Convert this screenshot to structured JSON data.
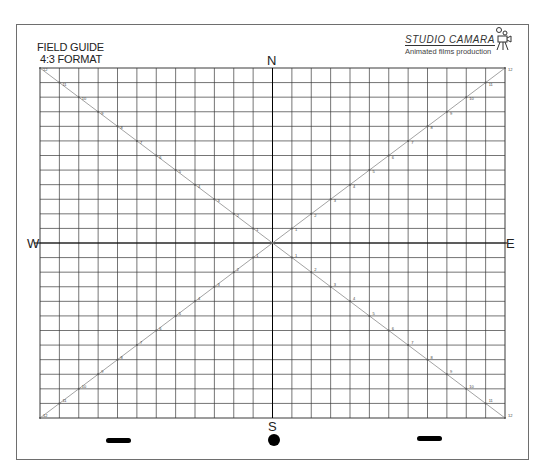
{
  "header": {
    "title_line1": "FIELD GUIDE",
    "title_line2": "4:3 FORMAT"
  },
  "logo": {
    "name": "STUDIO CAMARA",
    "tagline": "Animated films production",
    "icon": "camera-doodle-icon"
  },
  "compass": {
    "north": "N",
    "south": "S",
    "east": "E",
    "west": "W"
  },
  "grid": {
    "columns": 24,
    "rows": 24,
    "left": 40,
    "top": 68,
    "right": 505,
    "bottom": 418,
    "line_color": "#3a3a3a",
    "axis_color": "#000000",
    "diagonal_color": "#8a8a8a",
    "field_labels": [
      12,
      11,
      10,
      9,
      8,
      7,
      6,
      5,
      4,
      3,
      2,
      1
    ]
  },
  "registration": {
    "left_bar": "peg-bar-left",
    "center_dot": "registration-dot",
    "right_bar": "peg-bar-right"
  }
}
